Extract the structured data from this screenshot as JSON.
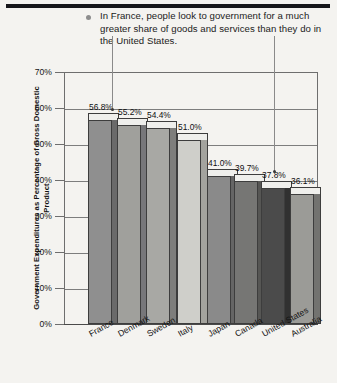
{
  "annotation": {
    "bullet": "round-bullet",
    "text": "In France, people look to government for a much greater share of goods and services than they do in the United States."
  },
  "chart_data": {
    "type": "bar",
    "title": "",
    "xlabel": "",
    "ylabel": "Government Expenditures as Percentage of Gross Domestic Product",
    "ylim": [
      0,
      70
    ],
    "ytick_labels": [
      "70%",
      "60%",
      "50%",
      "40%",
      "30%",
      "20%",
      "10%",
      "0%"
    ],
    "ytick_values": [
      70,
      60,
      50,
      40,
      30,
      20,
      10,
      0
    ],
    "grid": true,
    "legend": "none",
    "categories": [
      "France",
      "Denmark",
      "Sweden",
      "Italy",
      "Japan",
      "Canada",
      "United States",
      "Australia"
    ],
    "values": [
      56.8,
      55.2,
      54.4,
      51.0,
      41.0,
      39.7,
      37.8,
      36.1
    ],
    "value_labels": [
      "56.8%",
      "55.2%",
      "54.4%",
      "51.0%",
      "41.0%",
      "39.7%",
      "37.8%",
      "36.1%"
    ],
    "bar_colors": [
      "#8f8f8f",
      "#a0a09c",
      "#a8a8a4",
      "#cfcfca",
      "#8a8a8a",
      "#767674",
      "#4b4b4b",
      "#9b9b97"
    ],
    "bar_side_colors": [
      "#6a6a6a",
      "#77777a",
      "#7e7e7c",
      "#a3a39e",
      "#656565",
      "#565654",
      "#313131",
      "#737370"
    ]
  }
}
